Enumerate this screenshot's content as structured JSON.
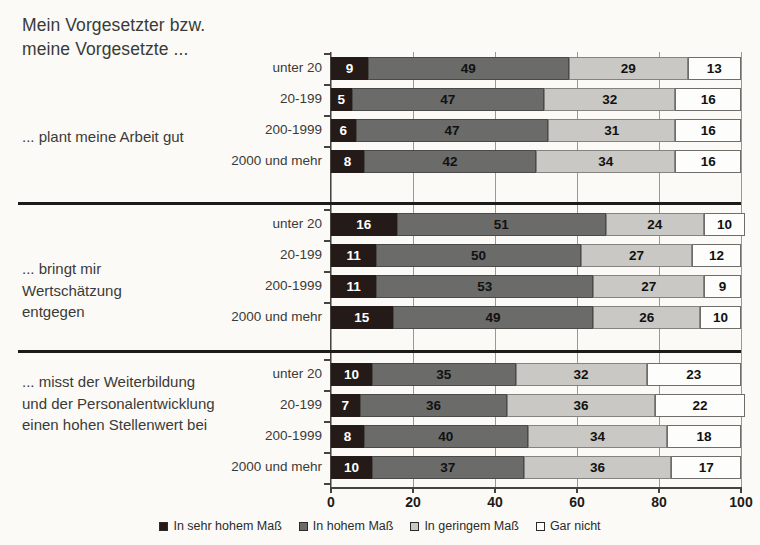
{
  "title": "Mein Vorgesetzter bzw.\nmeine Vorgesetzte ...",
  "legend": {
    "items": [
      {
        "label": "In sehr hohem Maß",
        "color": "#241a17",
        "swatch": "filled-square-dark"
      },
      {
        "label": "In hohem Maß",
        "color": "#6b6b69",
        "swatch": "filled-square-gray"
      },
      {
        "label": "In geringem Maß",
        "color": "#c9c8c4",
        "swatch": "filled-square-light"
      },
      {
        "label": "Gar nicht",
        "color": "#ffffff",
        "swatch": "empty-square"
      }
    ]
  },
  "axis": {
    "ticks": [
      "0",
      "20",
      "40",
      "60",
      "80",
      "100"
    ],
    "min": 0,
    "max": 100
  },
  "groups": [
    {
      "label": "... plant meine Arbeit gut",
      "rows": [
        {
          "category": "unter 20",
          "values": [
            9,
            49,
            29,
            13
          ]
        },
        {
          "category": "20-199",
          "values": [
            5,
            47,
            32,
            16
          ]
        },
        {
          "category": "200-1999",
          "values": [
            6,
            47,
            31,
            16
          ]
        },
        {
          "category": "2000 und mehr",
          "values": [
            8,
            42,
            34,
            16
          ]
        }
      ]
    },
    {
      "label": "... bringt mir\nWertschätzung\nentgegen",
      "rows": [
        {
          "category": "unter 20",
          "values": [
            16,
            51,
            24,
            10
          ]
        },
        {
          "category": "20-199",
          "values": [
            11,
            50,
            27,
            12
          ]
        },
        {
          "category": "200-1999",
          "values": [
            11,
            53,
            27,
            9
          ]
        },
        {
          "category": "2000 und mehr",
          "values": [
            15,
            49,
            26,
            10
          ]
        }
      ]
    },
    {
      "label": "... misst der Weiterbildung\nund der Personalentwicklung\neinen hohen Stellenwert bei",
      "rows": [
        {
          "category": "unter 20",
          "values": [
            10,
            35,
            32,
            23
          ]
        },
        {
          "category": "20-199",
          "values": [
            7,
            36,
            36,
            22
          ]
        },
        {
          "category": "200-1999",
          "values": [
            8,
            40,
            34,
            18
          ]
        },
        {
          "category": "2000 und mehr",
          "values": [
            10,
            37,
            36,
            17
          ]
        }
      ]
    }
  ],
  "chart_data": {
    "type": "bar",
    "orientation": "horizontal",
    "stacked": true,
    "title": "Mein Vorgesetzter bzw. meine Vorgesetzte ...",
    "xlabel": "",
    "ylabel": "",
    "xlim": [
      0,
      100
    ],
    "xticks": [
      0,
      20,
      40,
      60,
      80,
      100
    ],
    "grid": true,
    "legend_position": "bottom-center",
    "series": [
      {
        "name": "In sehr hohem Maß",
        "color": "#241a17",
        "values": [
          9,
          5,
          6,
          8,
          16,
          11,
          11,
          15,
          10,
          7,
          8,
          10
        ]
      },
      {
        "name": "In hohem Maß",
        "color": "#6b6b69",
        "values": [
          49,
          47,
          47,
          42,
          51,
          50,
          53,
          49,
          35,
          36,
          40,
          37
        ]
      },
      {
        "name": "In geringem Maß",
        "color": "#c9c8c4",
        "values": [
          29,
          32,
          31,
          34,
          24,
          27,
          27,
          26,
          32,
          36,
          34,
          36
        ]
      },
      {
        "name": "Gar nicht",
        "color": "#ffffff",
        "values": [
          13,
          16,
          16,
          16,
          10,
          12,
          9,
          10,
          23,
          22,
          18,
          17
        ]
      }
    ],
    "categories": [
      "... plant meine Arbeit gut | unter 20",
      "... plant meine Arbeit gut | 20-199",
      "... plant meine Arbeit gut | 200-1999",
      "... plant meine Arbeit gut | 2000 und mehr",
      "... bringt mir Wertschätzung entgegen | unter 20",
      "... bringt mir Wertschätzung entgegen | 20-199",
      "... bringt mir Wertschätzung entgegen | 200-1999",
      "... bringt mir Wertschätzung entgegen | 2000 und mehr",
      "... misst der Weiterbildung und der Personalentwicklung einen hohen Stellenwert bei | unter 20",
      "... misst der Weiterbildung und der Personalentwicklung einen hohen Stellenwert bei | 20-199",
      "... misst der Weiterbildung und der Personalentwicklung einen hohen Stellenwert bei | 200-1999",
      "... misst der Weiterbildung und der Personalentwicklung einen hohen Stellenwert bei | 2000 und mehr"
    ]
  }
}
